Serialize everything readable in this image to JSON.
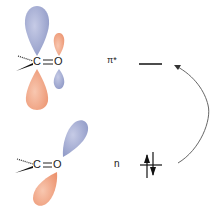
{
  "diagram": {
    "top_molecule": {
      "carbon": "C",
      "oxygen": "O",
      "bond": "="
    },
    "bottom_molecule": {
      "carbon": "C",
      "oxygen": "O",
      "bond": "="
    },
    "levels": [
      {
        "label": "π*",
        "electrons": 0
      },
      {
        "label": "n",
        "electrons": 2
      }
    ],
    "colors": {
      "lobe_blue": "#a9b1d4",
      "lobe_orange": "#f0a98a",
      "line": "#111111",
      "arrow": "#555555"
    }
  }
}
